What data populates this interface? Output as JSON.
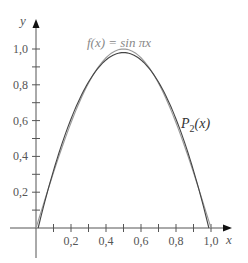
{
  "chart_data": {
    "type": "line",
    "title": "",
    "xlabel": "x",
    "ylabel": "y",
    "xlim": [
      -0.05,
      1.15
    ],
    "ylim": [
      -0.22,
      1.2
    ],
    "grid": false,
    "x_ticks": [
      0.1,
      0.2,
      0.3,
      0.4,
      0.5,
      0.6,
      0.7,
      0.8,
      0.9,
      1.0
    ],
    "x_tick_labels": [
      {
        "value": 0.2,
        "label": "0,2"
      },
      {
        "value": 0.4,
        "label": "0,4"
      },
      {
        "value": 0.6,
        "label": "0,6"
      },
      {
        "value": 0.8,
        "label": "0,8"
      },
      {
        "value": 1.0,
        "label": "1,0"
      }
    ],
    "y_ticks": [
      0.1,
      0.2,
      0.3,
      0.4,
      0.5,
      0.6,
      0.7,
      0.8,
      0.9,
      1.0
    ],
    "y_tick_labels": [
      {
        "value": 0.2,
        "label": "0,2"
      },
      {
        "value": 0.4,
        "label": "0,4"
      },
      {
        "value": 0.6,
        "label": "0,6"
      },
      {
        "value": 0.8,
        "label": "0,8"
      },
      {
        "value": 1.0,
        "label": "1,0"
      }
    ],
    "series": [
      {
        "name": "f(x) = sin πx",
        "function": "sin(pi*x)",
        "domain": [
          0,
          1
        ],
        "color": "#9a9a9a",
        "x": [
          0,
          0.1,
          0.2,
          0.3,
          0.4,
          0.5,
          0.6,
          0.7,
          0.8,
          0.9,
          1.0
        ],
        "y": [
          0,
          0.309,
          0.588,
          0.809,
          0.951,
          1.0,
          0.951,
          0.809,
          0.588,
          0.309,
          0
        ]
      },
      {
        "name": "P2(x)",
        "function": "quadratic approximation",
        "domain": [
          0,
          1
        ],
        "color": "#444444",
        "x": [
          0,
          0.1,
          0.2,
          0.3,
          0.4,
          0.5,
          0.6,
          0.7,
          0.8,
          0.9,
          1.0
        ],
        "y": [
          -0.05,
          0.321,
          0.609,
          0.815,
          0.939,
          0.98,
          0.939,
          0.815,
          0.609,
          0.321,
          -0.05
        ]
      }
    ],
    "annotations": [
      {
        "text_prefix": "f(x) = sin ",
        "text_pi": "π",
        "text_suffix": "x",
        "near": "top-center, above peak"
      },
      {
        "text_main": "P",
        "text_sub": "2",
        "text_suffix": "(x)",
        "near": "right side of descending curve"
      }
    ]
  }
}
